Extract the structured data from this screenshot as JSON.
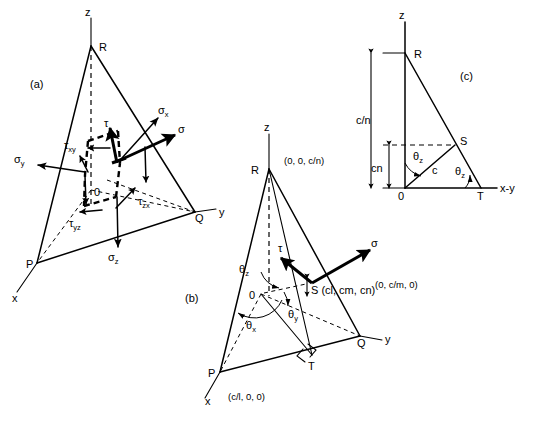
{
  "figure": {
    "panels": [
      {
        "id": "a",
        "caption": "(a)",
        "axes": [
          {
            "name": "z-axis-label",
            "text": "z"
          },
          {
            "name": "y-axis-label",
            "text": "y"
          },
          {
            "name": "x-axis-label",
            "text": "x"
          }
        ],
        "vertices": [
          {
            "name": "vertex-R",
            "text": "R"
          },
          {
            "name": "vertex-Q",
            "text": "Q"
          },
          {
            "name": "vertex-P",
            "text": "P"
          },
          {
            "name": "origin-O",
            "text": "0"
          }
        ],
        "stress_labels": [
          {
            "name": "sigma-x-label",
            "base": "σ",
            "sub": "x"
          },
          {
            "name": "sigma-y-label",
            "base": "σ",
            "sub": "y"
          },
          {
            "name": "sigma-z-label",
            "base": "σ",
            "sub": "z"
          },
          {
            "name": "sigma-label",
            "base": "σ",
            "sub": ""
          },
          {
            "name": "tau-label",
            "base": "τ",
            "sub": ""
          },
          {
            "name": "tau-xy-label",
            "base": "τ",
            "sub": "xy"
          },
          {
            "name": "tau-yz-label",
            "base": "τ",
            "sub": "yz"
          },
          {
            "name": "tau-zx-label",
            "base": "τ",
            "sub": "zx"
          }
        ]
      },
      {
        "id": "b",
        "caption": "(b)",
        "axes": [
          {
            "name": "z-axis-label",
            "text": "z"
          },
          {
            "name": "y-axis-label",
            "text": "y"
          },
          {
            "name": "x-axis-label",
            "text": "x"
          }
        ],
        "vertices": [
          {
            "name": "vertex-R",
            "text": "R"
          },
          {
            "name": "vertex-Q",
            "text": "Q"
          },
          {
            "name": "vertex-P",
            "text": "P"
          },
          {
            "name": "vertex-S",
            "text": "S (cl, cm, cn)"
          },
          {
            "name": "vertex-T",
            "text": "T"
          },
          {
            "name": "origin-O",
            "text": "0"
          }
        ],
        "coordinates": [
          {
            "name": "coord-R",
            "text": "(0, 0, c/n)"
          },
          {
            "name": "coord-Q",
            "text": "(0, c/m, 0)"
          },
          {
            "name": "coord-P",
            "text": "(c/l, 0, 0)"
          }
        ],
        "angles": [
          {
            "name": "theta-z-label",
            "base": "θ",
            "sub": "z"
          },
          {
            "name": "theta-y-label",
            "base": "θ",
            "sub": "y"
          },
          {
            "name": "theta-x-label",
            "base": "θ",
            "sub": "x"
          }
        ],
        "stress_labels": [
          {
            "name": "sigma-label",
            "base": "σ",
            "sub": ""
          },
          {
            "name": "tau-label",
            "base": "τ",
            "sub": ""
          }
        ]
      },
      {
        "id": "c",
        "caption": "(c)",
        "axes": [
          {
            "name": "z-axis-label",
            "text": "z"
          },
          {
            "name": "xy-axis-label",
            "text": "x-y"
          }
        ],
        "vertices": [
          {
            "name": "vertex-R",
            "text": "R"
          },
          {
            "name": "vertex-S",
            "text": "S"
          },
          {
            "name": "vertex-T",
            "text": "T"
          },
          {
            "name": "origin-O",
            "text": "0"
          }
        ],
        "dimensions": [
          {
            "name": "dim-c-over-n-label",
            "text": "c/n"
          },
          {
            "name": "dim-cn-label",
            "text": "cn"
          },
          {
            "name": "segment-c-label",
            "text": "c"
          }
        ],
        "angles": [
          {
            "name": "theta-z-upper-label",
            "base": "θ",
            "sub": "z"
          },
          {
            "name": "theta-z-lower-label",
            "base": "θ",
            "sub": "z"
          }
        ]
      }
    ],
    "colors": {
      "stroke": "#000000",
      "background": "#ffffff"
    }
  }
}
